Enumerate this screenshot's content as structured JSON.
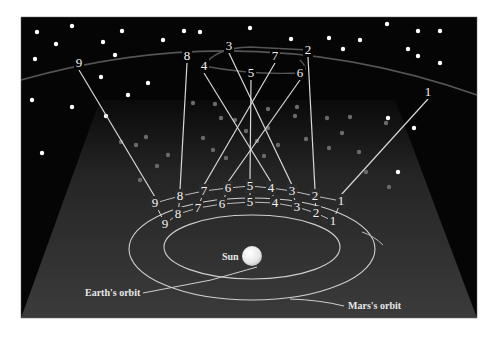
{
  "figure": {
    "colors": {
      "background": "#ffffff",
      "sky": "#050505",
      "cone_top": "#1a1a1a",
      "cone_bottom": "#3a3a3a",
      "line": "#d8d8d8",
      "ecliptic": "#555555",
      "star": "#ffffff",
      "faint_star": "#6a6a6a",
      "sun": "#f4f4f4"
    },
    "labels": {
      "sun": "Sun",
      "earth_orbit": "Earth's orbit",
      "mars_orbit": "Mars's orbit"
    },
    "sky_positions": [
      {
        "n": "1",
        "x": 428,
        "y": 92
      },
      {
        "n": "2",
        "x": 308,
        "y": 50
      },
      {
        "n": "3",
        "x": 229,
        "y": 46
      },
      {
        "n": "4",
        "x": 204,
        "y": 66
      },
      {
        "n": "5",
        "x": 251,
        "y": 73
      },
      {
        "n": "6",
        "x": 300,
        "y": 73
      },
      {
        "n": "7",
        "x": 275,
        "y": 56
      },
      {
        "n": "8",
        "x": 187,
        "y": 56
      },
      {
        "n": "9",
        "x": 79,
        "y": 63
      }
    ],
    "mars_positions": [
      {
        "n": "1",
        "x": 341,
        "y": 201
      },
      {
        "n": "2",
        "x": 315,
        "y": 196
      },
      {
        "n": "3",
        "x": 292,
        "y": 191
      },
      {
        "n": "4",
        "x": 271,
        "y": 188
      },
      {
        "n": "5",
        "x": 250,
        "y": 186
      },
      {
        "n": "6",
        "x": 228,
        "y": 188
      },
      {
        "n": "7",
        "x": 204,
        "y": 191
      },
      {
        "n": "8",
        "x": 180,
        "y": 196
      },
      {
        "n": "9",
        "x": 155,
        "y": 203
      }
    ],
    "earth_positions": [
      {
        "n": "1",
        "x": 333,
        "y": 221
      },
      {
        "n": "2",
        "x": 316,
        "y": 213
      },
      {
        "n": "3",
        "x": 297,
        "y": 207
      },
      {
        "n": "4",
        "x": 275,
        "y": 203
      },
      {
        "n": "5",
        "x": 250,
        "y": 202
      },
      {
        "n": "6",
        "x": 222,
        "y": 204
      },
      {
        "n": "7",
        "x": 198,
        "y": 208
      },
      {
        "n": "8",
        "x": 178,
        "y": 214
      },
      {
        "n": "9",
        "x": 165,
        "y": 224
      }
    ],
    "bright_stars": [
      [
        37,
        32
      ],
      [
        72,
        26
      ],
      [
        122,
        31
      ],
      [
        56,
        44
      ],
      [
        103,
        42
      ],
      [
        35,
        59
      ],
      [
        184,
        31
      ],
      [
        163,
        40
      ],
      [
        115,
        55
      ],
      [
        227,
        14
      ],
      [
        200,
        32
      ],
      [
        250,
        28
      ],
      [
        291,
        39
      ],
      [
        329,
        38
      ],
      [
        387,
        24
      ],
      [
        360,
        40
      ],
      [
        418,
        31
      ],
      [
        440,
        31
      ],
      [
        408,
        49
      ],
      [
        440,
        63
      ],
      [
        343,
        49
      ],
      [
        418,
        56
      ],
      [
        32,
        100
      ],
      [
        72,
        107
      ],
      [
        42,
        153
      ],
      [
        101,
        77
      ],
      [
        148,
        83
      ],
      [
        128,
        95
      ],
      [
        388,
        118
      ],
      [
        414,
        128
      ],
      [
        398,
        172
      ],
      [
        106,
        116
      ]
    ],
    "faint_stars": [
      [
        146,
        137
      ],
      [
        136,
        145
      ],
      [
        168,
        155
      ],
      [
        157,
        166
      ],
      [
        193,
        103
      ],
      [
        215,
        104
      ],
      [
        221,
        118
      ],
      [
        213,
        150
      ],
      [
        235,
        120
      ],
      [
        246,
        131
      ],
      [
        268,
        109
      ],
      [
        268,
        128
      ],
      [
        257,
        141
      ],
      [
        278,
        145
      ],
      [
        264,
        156
      ],
      [
        295,
        116
      ],
      [
        327,
        118
      ],
      [
        306,
        139
      ],
      [
        297,
        107
      ],
      [
        350,
        117
      ],
      [
        342,
        133
      ],
      [
        329,
        148
      ],
      [
        386,
        123
      ],
      [
        359,
        152
      ],
      [
        366,
        172
      ],
      [
        389,
        187
      ],
      [
        121,
        142
      ],
      [
        140,
        180
      ],
      [
        203,
        138
      ],
      [
        226,
        158
      ]
    ]
  }
}
